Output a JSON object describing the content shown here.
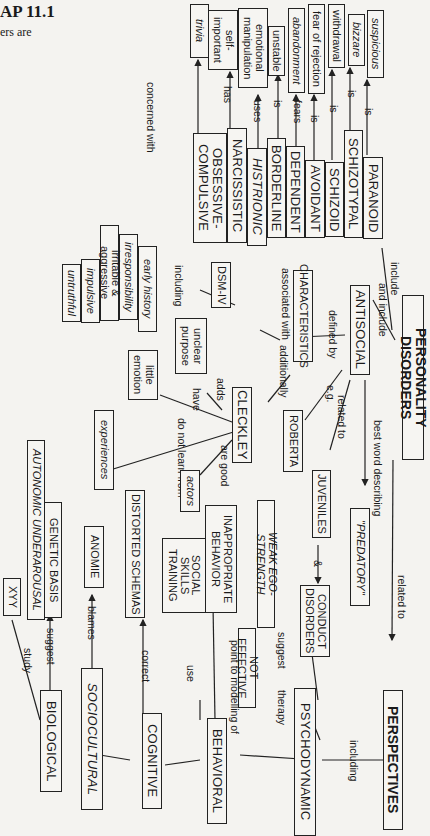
{
  "page_header": {
    "title": "AP 11.1",
    "subtitle": "ers are"
  },
  "root": "PERSONALITY DISORDERS",
  "disorders": [
    {
      "name": "PARANOID",
      "link": "is",
      "trait": "suspicious"
    },
    {
      "name": "SCHIZOTYPAL",
      "link": "is",
      "trait": "bizzare"
    },
    {
      "name": "SCHIZOID",
      "link": "is",
      "trait": "withdrawal"
    },
    {
      "name": "AVOIDANT",
      "link": "is",
      "trait": "fear of rejection"
    },
    {
      "name": "DEPENDENT",
      "link": "fears",
      "trait": "abandonment"
    },
    {
      "name": "BORDERLINE",
      "link": "is",
      "trait": "unstable"
    },
    {
      "name": "HISTRIONIC",
      "link": "uses",
      "trait": "emotional manipulation"
    },
    {
      "name": "NARCISSISTIC",
      "link": "has",
      "trait": "self-important"
    },
    {
      "name": "OBSESSIVE-COMPULSIVE",
      "link": "concerned with",
      "trait": "trivia"
    }
  ],
  "antisocial": {
    "name": "ANTISOCIAL",
    "link_include": "include",
    "link_and_include": "and include",
    "defined_by": "defined by",
    "characteristics": "CHARACTERISTICS",
    "associated_with": "associated with",
    "dsm": "DSM-IV",
    "including": "including",
    "dsm_items": [
      "early history",
      "irresponsibility",
      "irritable & aggressive",
      "impulsive",
      "untruthful"
    ],
    "additionally": "additionally",
    "cleckley": "CLECKLEY",
    "cleckley_links": [
      {
        "link": "adds",
        "target": "unclear purpose"
      },
      {
        "link": "have",
        "target": "little emotion"
      },
      {
        "link": "do not learn from",
        "target": "experiences"
      },
      {
        "link": "are good",
        "target": "actors"
      }
    ],
    "eg": "e.g.",
    "roberta": "ROBERTA",
    "related_to": "related to",
    "juveniles": "JUVENILES",
    "amp": "&",
    "conduct": "CONDUCT DISORDERS",
    "best_word": "best word describing",
    "predatory": "\"PREDATORY\""
  },
  "perspectives": {
    "related_to": "related to",
    "name": "PERSPECTIVES",
    "including": "including",
    "items": [
      {
        "name": "PSYCHODYNAMIC",
        "suggest": "suggest",
        "target": "WEAK EGO-STRENGTH",
        "therapy": "therapy",
        "therapy_target": "NOT EFFECTIVE"
      },
      {
        "name": "BEHAVIORAL",
        "point_to": "point to modelling of",
        "target": "INAPPROPRIATE BEHAVIOR",
        "use": "use",
        "use_target": "SOCIAL SKILLS TRAINING"
      },
      {
        "name": "COGNITIVE",
        "link": "correct",
        "target": "DISTORTED SCHEMAS"
      },
      {
        "name": "SOCIOCULTURAL",
        "link": "blames",
        "target": "ANOMIE"
      },
      {
        "name": "BIOLOGICAL",
        "suggest": "suggest",
        "target": "GENETIC BASIS",
        "target2": "AUTONOMIC UNDERAROUSAL",
        "study": "study",
        "study_target": "XYY"
      }
    ]
  }
}
